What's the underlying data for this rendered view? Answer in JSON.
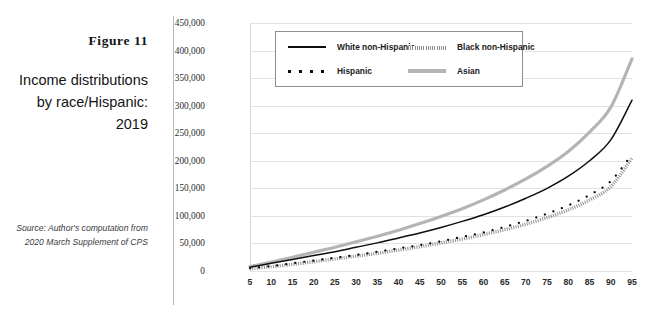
{
  "figure": {
    "label_prefix": "F",
    "label": "Figure 11",
    "title": "Income distributions by race/Hispanic: 2019",
    "source": "Source: Author's computation from 2020 March Supplement of CPS"
  },
  "colors": {
    "white_non_hispanic": "#0d0d0d",
    "black_non_hispanic": "#8f8f8f",
    "hispanic": "#0d0d0d",
    "asian": "#b4b4b4",
    "gridline": "#e2e2e2",
    "rule": "#b9b9b9",
    "text": "#1a1a1a"
  },
  "chart_data": {
    "type": "line",
    "title": "Income distributions by race/Hispanic: 2019",
    "xlabel": "",
    "ylabel": "",
    "xlim": [
      5,
      95
    ],
    "ylim": [
      0,
      450000
    ],
    "grid": true,
    "legend_position": "top-left-inside",
    "ytick_labels": [
      "450,000",
      "400,000",
      "350,000",
      "300,000",
      "250,000",
      "200,000",
      "150,000",
      "100,000",
      "50,000",
      "0"
    ],
    "ytick_values": [
      450000,
      400000,
      350000,
      300000,
      250000,
      200000,
      150000,
      100000,
      50000,
      0
    ],
    "xtick_labels": [
      "5",
      "10",
      "15",
      "20",
      "25",
      "30",
      "35",
      "40",
      "45",
      "50",
      "55",
      "60",
      "65",
      "70",
      "75",
      "80",
      "85",
      "90",
      "95"
    ],
    "x": [
      5,
      10,
      15,
      20,
      25,
      30,
      35,
      40,
      45,
      50,
      55,
      60,
      65,
      70,
      75,
      80,
      85,
      90,
      95
    ],
    "series": [
      {
        "name": "White non-Hispanic",
        "style": "solid",
        "color": "#0d0d0d",
        "values": [
          7000,
          14000,
          21000,
          28000,
          35000,
          43000,
          51000,
          60000,
          69000,
          79000,
          90000,
          102000,
          116000,
          132000,
          150000,
          172000,
          200000,
          238000,
          310000
        ]
      },
      {
        "name": "Black non-Hispanic",
        "style": "hatched",
        "color": "#8f8f8f",
        "values": [
          4000,
          8000,
          12000,
          17000,
          22000,
          27000,
          32000,
          38000,
          44000,
          51000,
          58000,
          66000,
          75000,
          85000,
          97000,
          111000,
          129000,
          153000,
          205000
        ]
      },
      {
        "name": "Hispanic",
        "style": "dotted",
        "color": "#0d0d0d",
        "values": [
          5000,
          9000,
          14000,
          19000,
          24000,
          29000,
          35000,
          41000,
          47000,
          54000,
          62000,
          70000,
          80000,
          91000,
          104000,
          119000,
          138000,
          163000,
          212000
        ]
      },
      {
        "name": "Asian",
        "style": "thick",
        "color": "#b4b4b4",
        "values": [
          8000,
          16000,
          25000,
          34000,
          43000,
          53000,
          63000,
          74000,
          86000,
          99000,
          113000,
          129000,
          147000,
          167000,
          190000,
          217000,
          252000,
          297000,
          385000
        ]
      }
    ]
  },
  "legend": {
    "items": [
      {
        "label": "White non-Hispanic",
        "key": "solid-line-key"
      },
      {
        "label": "Black non-Hispanic",
        "key": "hatched-line-key"
      },
      {
        "label": "Hispanic",
        "key": "dotted-line-key"
      },
      {
        "label": "Asian",
        "key": "thick-gray-line-key"
      }
    ]
  }
}
